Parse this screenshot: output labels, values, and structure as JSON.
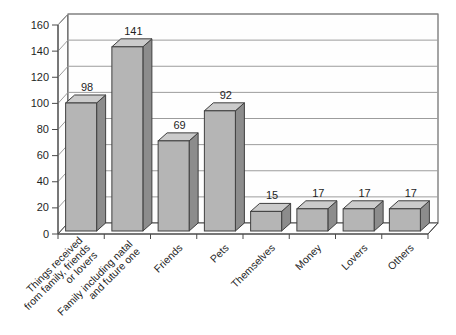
{
  "chart_data": {
    "type": "bar",
    "style": "3d-column",
    "title": "",
    "xlabel": "",
    "ylabel": "",
    "categories": [
      "Things received from family, friends or lovers",
      "Family including natal and future one",
      "Friends",
      "Pets",
      "Themselves",
      "Money",
      "Lovers",
      "Others"
    ],
    "category_label_lines": [
      [
        "Things received",
        "from family, friends",
        "or lovers"
      ],
      [
        "Family including natal",
        "and future one"
      ],
      [
        "Friends"
      ],
      [
        "Pets"
      ],
      [
        "Themselves"
      ],
      [
        "Money"
      ],
      [
        "Lovers"
      ],
      [
        "Others"
      ]
    ],
    "values": [
      98,
      141,
      69,
      92,
      15,
      17,
      17,
      17
    ],
    "data_labels": [
      "98",
      "141",
      "69",
      "92",
      "15",
      "17",
      "17",
      "17"
    ],
    "ylim": [
      0,
      160
    ],
    "ytick_step": 20,
    "yticks": [
      "0",
      "20",
      "40",
      "60",
      "80",
      "100",
      "120",
      "140",
      "160"
    ],
    "grid": true,
    "legend": "none",
    "colors": {
      "background": "#ffffff",
      "wall_fill": "#fefefe",
      "gridline": "#9c9c9c",
      "axis": "#4a4a4a",
      "bar_front": "#b5b5b5",
      "bar_top": "#cbcbcb",
      "bar_side": "#8c8c8c",
      "bar_outline": "#3f3f3f",
      "text": "#1f1f1f"
    }
  }
}
